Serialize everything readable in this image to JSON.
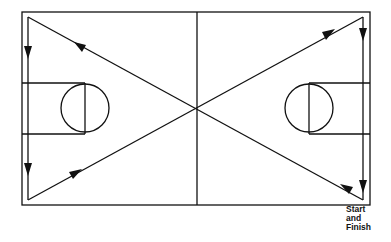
{
  "diagram": {
    "type": "basketball-court-drill",
    "line_color": "#111111",
    "background": "#ffffff",
    "court": {
      "x": 22,
      "y": 12,
      "width": 348,
      "height": 193
    },
    "center_line_x": 197,
    "keys": [
      {
        "side": "left",
        "x1": 22,
        "x2": 85,
        "y1": 83,
        "y2": 134,
        "circle": {
          "cx": 85,
          "cy": 108,
          "r": 24
        }
      },
      {
        "side": "right",
        "x1": 309,
        "x2": 370,
        "y1": 83,
        "y2": 134,
        "circle": {
          "cx": 309,
          "cy": 108,
          "r": 24
        }
      }
    ],
    "path": [
      {
        "from": [
          363,
          200
        ],
        "to": [
          28,
          17
        ],
        "arrow_at": [
          83,
          47
        ],
        "direction": "up-left"
      },
      {
        "from": [
          28,
          17
        ],
        "to": [
          28,
          200
        ],
        "arrow_at": [
          28,
          53
        ],
        "direction": "down"
      },
      {
        "from": [
          28,
          200
        ],
        "to": [
          363,
          17
        ],
        "arrow_at": [
          75,
          174
        ],
        "direction": "up-right"
      },
      {
        "from": [
          363,
          17
        ],
        "to": [
          363,
          200
        ],
        "arrow_at": [
          363,
          35
        ],
        "direction": "down"
      }
    ],
    "extra_arrows": [
      {
        "at": [
          28,
          190
        ],
        "direction": "down"
      },
      {
        "at": [
          328,
          15
        ],
        "direction": "up-right"
      },
      {
        "at": [
          363,
          180
        ],
        "direction": "down"
      },
      {
        "at": [
          345,
          189
        ],
        "direction": "down-right"
      }
    ],
    "label": {
      "lines": [
        "Start",
        "and",
        "Finish"
      ]
    }
  }
}
